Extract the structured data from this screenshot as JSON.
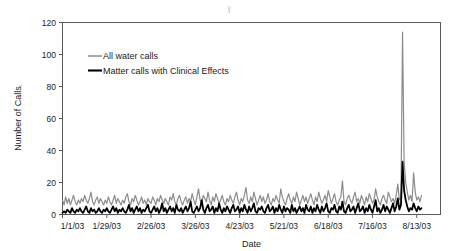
{
  "chart_data": {
    "type": "line",
    "title": "",
    "xlabel": "Date",
    "ylabel": "Number of Calls",
    "ylim": [
      0,
      120
    ],
    "yticks": [
      0,
      20,
      40,
      60,
      80,
      100,
      120
    ],
    "grid": false,
    "legend_position": "upper-left-inside",
    "xtick_labels": [
      "1/1/03",
      "1/29/03",
      "2/26/03",
      "3/26/03",
      "4/23/03",
      "5/21/03",
      "6/18/03",
      "7/16/03",
      "8/13/03"
    ],
    "xtick_indices": [
      0,
      28,
      56,
      84,
      112,
      140,
      168,
      196,
      224
    ],
    "x_count": 240,
    "x_start": "1/1/03",
    "x_end": "8/28/03",
    "annotations": [
      "Spike in both series occurs immediately after 8/13/03"
    ],
    "series": [
      {
        "name": "All water calls",
        "color": "#8c8c8c",
        "line_width": 1.2,
        "peak_value": 114,
        "peak_index": 226,
        "typical_range": [
          4,
          22
        ],
        "values": [
          9,
          6,
          11,
          7,
          10,
          6,
          9,
          12,
          8,
          6,
          9,
          7,
          10,
          8,
          12,
          9,
          7,
          10,
          14,
          8,
          6,
          9,
          11,
          7,
          10,
          8,
          6,
          9,
          7,
          11,
          8,
          6,
          9,
          12,
          7,
          10,
          8,
          6,
          9,
          7,
          11,
          13,
          8,
          6,
          10,
          8,
          12,
          9,
          6,
          8,
          11,
          7,
          9,
          6,
          10,
          8,
          7,
          11,
          9,
          6,
          10,
          8,
          12,
          9,
          7,
          10,
          8,
          6,
          11,
          9,
          13,
          8,
          6,
          10,
          12,
          8,
          6,
          9,
          11,
          7,
          10,
          8,
          13,
          9,
          6,
          11,
          16,
          9,
          7,
          12,
          10,
          8,
          14,
          9,
          6,
          11,
          8,
          13,
          10,
          7,
          9,
          12,
          8,
          6,
          10,
          8,
          12,
          9,
          7,
          11,
          14,
          9,
          6,
          10,
          8,
          12,
          17,
          9,
          7,
          11,
          8,
          14,
          10,
          6,
          9,
          12,
          8,
          11,
          7,
          9,
          13,
          8,
          6,
          10,
          8,
          12,
          9,
          7,
          16,
          11,
          8,
          6,
          10,
          13,
          9,
          7,
          11,
          8,
          14,
          10,
          6,
          9,
          12,
          8,
          11,
          7,
          10,
          13,
          9,
          6,
          11,
          8,
          14,
          10,
          7,
          9,
          12,
          8,
          15,
          11,
          7,
          10,
          13,
          8,
          6,
          9,
          11,
          21,
          8,
          6,
          10,
          12,
          9,
          7,
          11,
          14,
          8,
          10,
          7,
          12,
          9,
          6,
          11,
          8,
          13,
          10,
          7,
          9,
          16,
          11,
          8,
          6,
          10,
          12,
          9,
          7,
          14,
          11,
          8,
          10,
          7,
          12,
          19,
          9,
          11,
          114,
          33,
          20,
          14,
          9,
          12,
          8,
          26,
          14,
          9,
          11,
          8,
          12
        ]
      },
      {
        "name": "Matter calls with Clinical Effects",
        "color": "#000000",
        "line_width": 1.8,
        "peak_value": 33,
        "peak_index": 227,
        "typical_range": [
          0,
          10
        ],
        "values": [
          1,
          2,
          1,
          3,
          2,
          1,
          4,
          2,
          1,
          3,
          2,
          4,
          2,
          1,
          3,
          5,
          2,
          1,
          4,
          2,
          3,
          1,
          2,
          4,
          2,
          1,
          3,
          2,
          4,
          2,
          1,
          3,
          5,
          2,
          4,
          1,
          3,
          2,
          4,
          2,
          1,
          3,
          6,
          2,
          4,
          1,
          3,
          5,
          2,
          4,
          1,
          3,
          2,
          4,
          6,
          2,
          1,
          3,
          5,
          2,
          4,
          1,
          3,
          7,
          2,
          4,
          1,
          3,
          5,
          2,
          4,
          1,
          6,
          3,
          2,
          4,
          1,
          3,
          5,
          2,
          4,
          8,
          2,
          1,
          3,
          5,
          2,
          4,
          9,
          3,
          1,
          4,
          6,
          2,
          3,
          5,
          1,
          4,
          2,
          7,
          3,
          1,
          4,
          2,
          5,
          3,
          1,
          4,
          6,
          2,
          3,
          5,
          1,
          4,
          2,
          6,
          3,
          1,
          5,
          2,
          4,
          7,
          2,
          1,
          4,
          3,
          5,
          2,
          1,
          4,
          6,
          2,
          3,
          5,
          1,
          4,
          2,
          6,
          3,
          1,
          5,
          2,
          4,
          3,
          1,
          6,
          2,
          4,
          1,
          3,
          5,
          2,
          4,
          1,
          6,
          3,
          2,
          5,
          1,
          4,
          2,
          6,
          3,
          1,
          5,
          2,
          4,
          7,
          2,
          1,
          4,
          3,
          6,
          2,
          1,
          5,
          3,
          8,
          2,
          1,
          4,
          6,
          2,
          3,
          5,
          1,
          4,
          7,
          2,
          3,
          5,
          1,
          4,
          2,
          6,
          3,
          1,
          5,
          9,
          2,
          4,
          1,
          3,
          6,
          2,
          5,
          3,
          1,
          4,
          7,
          2,
          5,
          10,
          3,
          6,
          33,
          15,
          9,
          5,
          2,
          4,
          3,
          7,
          4,
          2,
          5,
          3,
          4
        ]
      }
    ]
  },
  "legend": {
    "entries": [
      {
        "label": "All water calls",
        "color": "#8c8c8c"
      },
      {
        "label": "Matter calls with Clinical Effects",
        "color": "#000000"
      }
    ]
  },
  "axes": {
    "y_title": "Number of Calls",
    "x_title": "Date"
  }
}
